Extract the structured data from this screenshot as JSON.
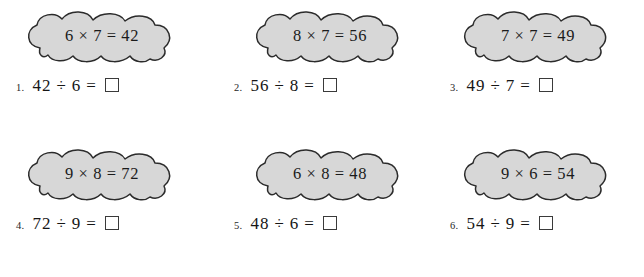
{
  "page": {
    "background_color": "#ffffff",
    "cloud_fill_color": "#d7d7d7",
    "cloud_outline_color": "#2b2b2b",
    "text_color": "#161616"
  },
  "problems": [
    {
      "number": "1.",
      "fact": "6 × 7 = 42",
      "equation": "42 ÷ 6 =",
      "answer": ""
    },
    {
      "number": "2.",
      "fact": "8 × 7 = 56",
      "equation": "56 ÷ 8 =",
      "answer": ""
    },
    {
      "number": "3.",
      "fact": "7 × 7 = 49",
      "equation": "49 ÷ 7 =",
      "answer": ""
    },
    {
      "number": "4.",
      "fact": "9 × 8 = 72",
      "equation": "72 ÷ 9 =",
      "answer": ""
    },
    {
      "number": "5.",
      "fact": "6 × 8 = 48",
      "equation": "48 ÷ 6 =",
      "answer": ""
    },
    {
      "number": "6.",
      "fact": "9 × 6 = 54",
      "equation": "54 ÷ 9 =",
      "answer": ""
    }
  ]
}
